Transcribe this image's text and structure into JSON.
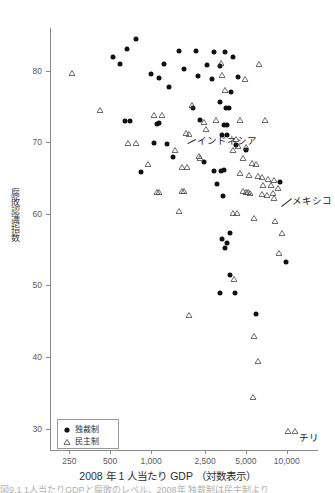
{
  "chart_data": {
    "type": "scatter",
    "title": "",
    "xlabel": "2008 年 1 人当たり GDP （対数表示）",
    "ylabel": "腐敗認識指数",
    "x_scale": "log",
    "xlim": [
      180,
      17000
    ],
    "ylim": [
      27,
      86
    ],
    "grid": false,
    "x_ticks": [
      "250",
      "500",
      "1,000",
      "2,500",
      "5,000",
      "10,000"
    ],
    "x_tick_values": [
      250,
      500,
      1000,
      2500,
      5000,
      10000
    ],
    "y_ticks": [
      "30",
      "40",
      "50",
      "60",
      "70",
      "80"
    ],
    "y_tick_values": [
      30,
      40,
      50,
      60,
      70,
      80
    ],
    "legend_position": "bottom-left",
    "series": [
      {
        "name": "独裁制",
        "marker": "filled-circle",
        "color": "#111111",
        "points": [
          [
            770,
            84.5
          ],
          [
            660,
            83.0
          ],
          [
            1600,
            82.8
          ],
          [
            2150,
            82.8
          ],
          [
            520,
            82.0
          ],
          [
            2900,
            82.6
          ],
          [
            3500,
            82.6
          ],
          [
            4050,
            82.0
          ],
          [
            590,
            81.0
          ],
          [
            1250,
            80.9
          ],
          [
            1750,
            80.2
          ],
          [
            2600,
            80.8
          ],
          [
            3200,
            80.7
          ],
          [
            1000,
            79.6
          ],
          [
            1150,
            79.0
          ],
          [
            2200,
            79.3
          ],
          [
            2800,
            78.9
          ],
          [
            4400,
            79.2
          ],
          [
            1350,
            77.8
          ],
          [
            3900,
            77.0
          ],
          [
            3200,
            75.6
          ],
          [
            2050,
            74.8
          ],
          [
            3550,
            74.8
          ],
          [
            3750,
            74.8
          ],
          [
            640,
            73.0
          ],
          [
            700,
            73.0
          ],
          [
            1100,
            72.6
          ],
          [
            1150,
            72.7
          ],
          [
            2300,
            73.2
          ],
          [
            3450,
            72.4
          ],
          [
            3650,
            72.4
          ],
          [
            3350,
            71.0
          ],
          [
            3600,
            71.0
          ],
          [
            1050,
            69.9
          ],
          [
            1300,
            69.8
          ],
          [
            4200,
            69.7
          ],
          [
            5000,
            69.0
          ],
          [
            1450,
            67.9
          ],
          [
            2450,
            67.3
          ],
          [
            3450,
            66.2
          ],
          [
            2900,
            66.0
          ],
          [
            3250,
            66.0
          ],
          [
            840,
            65.9
          ],
          [
            3050,
            64.2
          ],
          [
            8900,
            64.5
          ],
          [
            3400,
            62.5
          ],
          [
            3350,
            56.5
          ],
          [
            3600,
            56.0
          ],
          [
            3500,
            55.2
          ],
          [
            3800,
            57.4
          ],
          [
            9800,
            53.3
          ],
          [
            3850,
            51.4
          ],
          [
            3200,
            49.0
          ],
          [
            4150,
            48.9
          ],
          [
            5900,
            46.0
          ]
        ]
      },
      {
        "name": "民主制",
        "marker": "open-triangle",
        "color": "#3c3c3c",
        "points": [
          [
            260,
            80.8
          ],
          [
            3300,
            82.2
          ],
          [
            6200,
            82.1
          ],
          [
            3350,
            80.6
          ],
          [
            4900,
            80.0
          ],
          [
            3500,
            78.4
          ],
          [
            420,
            75.6
          ],
          [
            2000,
            76.4
          ],
          [
            1050,
            75.0
          ],
          [
            1200,
            75.0
          ],
          [
            2450,
            74.0
          ],
          [
            3000,
            74.2
          ],
          [
            4500,
            74.3
          ],
          [
            6900,
            74.3
          ],
          [
            2550,
            73.0
          ],
          [
            1800,
            72.5
          ],
          [
            1900,
            72.3
          ],
          [
            680,
            71.0
          ],
          [
            780,
            71.0
          ],
          [
            4250,
            71.6
          ],
          [
            4350,
            70.6
          ],
          [
            5050,
            70.5
          ],
          [
            1500,
            70.0
          ],
          [
            4050,
            70.0
          ],
          [
            2250,
            69.2
          ],
          [
            2300,
            69.0
          ],
          [
            4750,
            68.9
          ],
          [
            950,
            68.1
          ],
          [
            1700,
            67.7
          ],
          [
            1850,
            67.7
          ],
          [
            5500,
            68.2
          ],
          [
            5900,
            68.1
          ],
          [
            4550,
            66.8
          ],
          [
            5300,
            66.5
          ],
          [
            6100,
            66.4
          ],
          [
            6600,
            66.3
          ],
          [
            7300,
            66.0
          ],
          [
            8100,
            65.9
          ],
          [
            6700,
            65.2
          ],
          [
            7600,
            65.2
          ],
          [
            8600,
            64.8
          ],
          [
            7900,
            64.0
          ],
          [
            1100,
            64.2
          ],
          [
            1150,
            64.2
          ],
          [
            1700,
            64.3
          ],
          [
            1750,
            64.3
          ],
          [
            4750,
            64.3
          ],
          [
            5000,
            64.2
          ],
          [
            5150,
            64.2
          ],
          [
            5400,
            64.1
          ],
          [
            6600,
            63.9
          ],
          [
            7100,
            63.8
          ],
          [
            8100,
            63.4
          ],
          [
            1600,
            61.5
          ],
          [
            4000,
            61.3
          ],
          [
            4300,
            61.2
          ],
          [
            5700,
            60.5
          ],
          [
            8200,
            60.2
          ],
          [
            9300,
            58.5
          ],
          [
            8700,
            55.6
          ],
          [
            4100,
            52.0
          ],
          [
            1900,
            47.0
          ],
          [
            5700,
            44.0
          ],
          [
            6100,
            40.5
          ],
          [
            5600,
            35.5
          ],
          [
            10200,
            30.8
          ],
          [
            11600,
            30.8
          ]
        ]
      }
    ],
    "annotations": [
      {
        "label": "インドネシア",
        "x": 1850,
        "y": 72.0
      },
      {
        "label": "メキシコ",
        "x": 8300,
        "y": 64.0
      },
      {
        "label": "チリ",
        "x": 10900,
        "y": 29.6
      }
    ]
  },
  "legend": {
    "items": [
      {
        "label": "独裁制",
        "marker": "filled-circle"
      },
      {
        "label": "民主制",
        "marker": "open-triangle"
      }
    ]
  },
  "caption": {
    "fragment": "図9.1 1人当たりGDPと腐敗のレベル、2008年 独裁制は民主制より"
  }
}
